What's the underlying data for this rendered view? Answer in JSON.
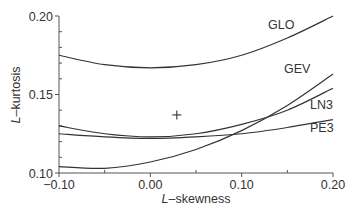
{
  "chart_data": {
    "type": "line",
    "title": "",
    "xlabel": "L-skewness",
    "ylabel": "L-kurtosis",
    "xlabel_italic_prefix": "L",
    "xlabel_suffix": "–skewness",
    "ylabel_italic_prefix": "L",
    "ylabel_suffix": "–kurtosis",
    "xlim": [
      -0.1,
      0.2
    ],
    "ylim": [
      0.1,
      0.2
    ],
    "x_ticks": [
      "-0.10",
      "0.00",
      "0.10",
      "0.20"
    ],
    "x_tick_labels": [
      "−0.10",
      "0.00",
      "0.10",
      "0.20"
    ],
    "y_ticks": [
      "0.10",
      "0.15",
      "0.20"
    ],
    "grid": false,
    "legend": "inline labels at right end of curves",
    "x": [
      -0.1,
      -0.05,
      0.0,
      0.05,
      0.1,
      0.15,
      0.2
    ],
    "series": [
      {
        "name": "GLO",
        "values": [
          0.175,
          0.169,
          0.167,
          0.169,
          0.175,
          0.186,
          0.2
        ]
      },
      {
        "name": "GEV",
        "values": [
          0.104,
          0.103,
          0.107,
          0.115,
          0.127,
          0.143,
          0.163
        ]
      },
      {
        "name": "LN3",
        "values": [
          0.13,
          0.125,
          0.123,
          0.125,
          0.131,
          0.14,
          0.154
        ]
      },
      {
        "name": "PE3",
        "values": [
          0.125,
          0.123,
          0.122,
          0.123,
          0.125,
          0.129,
          0.134
        ]
      }
    ],
    "points": [
      {
        "name": "regional average",
        "marker": "+",
        "x": 0.029,
        "y": 0.137
      }
    ]
  }
}
